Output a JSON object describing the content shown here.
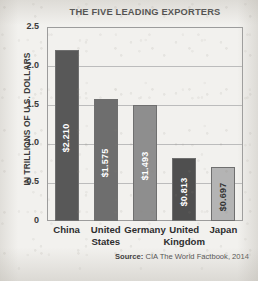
{
  "chart_data": {
    "type": "bar",
    "title": "THE FIVE LEADING EXPORTERS",
    "xlabel": "",
    "ylabel": "IN TRILLIONS OF U.S. DOLLARS",
    "categories": [
      "China",
      "United States",
      "Germany",
      "United Kingdom",
      "Japan"
    ],
    "values": [
      2.21,
      1.575,
      1.493,
      0.813,
      0.697
    ],
    "value_labels": [
      "$2.210",
      "$1.575",
      "$1.493",
      "$0.813",
      "$0.697"
    ],
    "bar_colors": [
      "#585858",
      "#6e6e6e",
      "#8e8e8e",
      "#4f4f4f",
      "#b4b4b4"
    ],
    "bar_label_colors": [
      "#ffffff",
      "#ffffff",
      "#ffffff",
      "#ffffff",
      "#333333"
    ],
    "ylim": [
      0,
      2.5
    ],
    "yticks": [
      0,
      0.5,
      1.0,
      1.5,
      2.0,
      2.5
    ],
    "ytick_labels": [
      "0",
      "0.5",
      "1.0",
      "1.5",
      "2.0",
      "2.5"
    ],
    "grid": true,
    "grid_axis": "y",
    "legend": false,
    "source_label": "Source:",
    "source_text": "CIA The World Factbook, 2014"
  },
  "category_lines": [
    [
      "China"
    ],
    [
      "United",
      "States"
    ],
    [
      "Germany"
    ],
    [
      "United",
      "Kingdom"
    ],
    [
      "Japan"
    ]
  ]
}
